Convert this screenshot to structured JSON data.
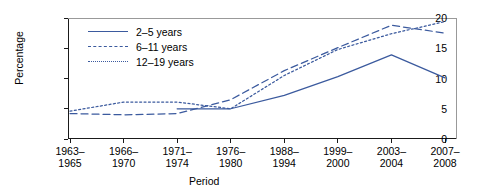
{
  "chart_data": {
    "type": "line",
    "title": "",
    "xlabel": "Period",
    "ylabel": "Percentage",
    "ylim": [
      0,
      20
    ],
    "yticks": [
      0,
      5,
      10,
      15,
      20
    ],
    "grid": false,
    "legend_position": "upper-left",
    "categories": [
      "1963–1965",
      "1966–1970",
      "1971–1974",
      "1976–1980",
      "1988–1994",
      "1999–2000",
      "2003–2004",
      "2007–2008"
    ],
    "series": [
      {
        "name": "2–5 years",
        "style": "solid",
        "color": "#3b5a9e",
        "values": [
          null,
          null,
          5.0,
          5.0,
          7.2,
          10.3,
          13.9,
          10.1
        ]
      },
      {
        "name": "6–11 years",
        "style": "dashed",
        "color": "#3b5a9e",
        "values": [
          4.2,
          4.0,
          4.2,
          6.5,
          11.3,
          15.1,
          18.8,
          17.5
        ]
      },
      {
        "name": "12–19 years",
        "style": "dotted",
        "color": "#3b5a9e",
        "values": [
          4.6,
          6.1,
          6.1,
          5.0,
          10.5,
          14.8,
          17.4,
          19.4
        ]
      }
    ]
  },
  "legend": {
    "items": [
      {
        "label": "2–5 years",
        "style": "solid"
      },
      {
        "label": "6–11 years",
        "style": "dashed"
      },
      {
        "label": "12–19 years",
        "style": "dotted"
      }
    ]
  },
  "axes": {
    "y_tick_labels": [
      "0",
      "5",
      "10",
      "15",
      "20"
    ],
    "y_axis_title": "Percentage",
    "x_axis_title": "Period",
    "x_tick_labels": [
      [
        "1963–",
        "1965"
      ],
      [
        "1966–",
        "1970"
      ],
      [
        "1971–",
        "1974"
      ],
      [
        "1976–",
        "1980"
      ],
      [
        "1988–",
        "1994"
      ],
      [
        "1999–",
        "2000"
      ],
      [
        "2003–",
        "2004"
      ],
      [
        "2007–",
        "2008"
      ]
    ]
  },
  "colors": {
    "series_line": "#3b5a9e",
    "axis": "#1a1a1a",
    "text": "#000000",
    "background": "#ffffff"
  }
}
